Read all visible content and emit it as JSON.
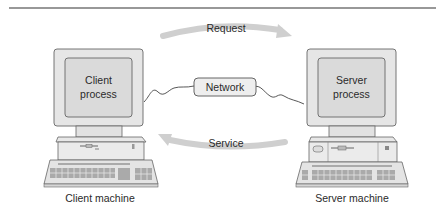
{
  "diagram": {
    "arrows": {
      "request_label": "Request",
      "service_label": "Service"
    },
    "network_label": "Network",
    "client": {
      "screen_line1": "Client",
      "screen_line2": "process",
      "caption": "Client machine"
    },
    "server": {
      "screen_line1": "Server",
      "screen_line2": "process",
      "caption": "Server machine"
    },
    "colors": {
      "arrow_gray": "#c8c8c8",
      "monitor_fill": "#e6e6e6",
      "screen_fill": "#dcdcdc",
      "outline": "#555555",
      "rule": "#333333"
    }
  }
}
